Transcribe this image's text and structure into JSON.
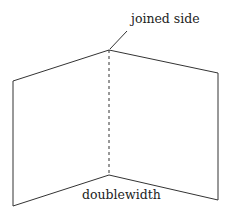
{
  "diagram": {
    "labels": {
      "top": "joined side",
      "bottom": "doublewidth"
    },
    "colors": {
      "stroke": "#333333",
      "background": "#ffffff"
    }
  }
}
